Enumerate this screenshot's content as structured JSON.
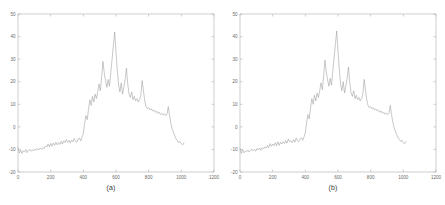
{
  "figure": {
    "background_color": "#ffffff",
    "axis_color": "#b9b9b9",
    "line_color": "#9a9a9a",
    "tick_label_color": "#6b6b6b",
    "caption_color": "#3a3a3a"
  },
  "panels": [
    {
      "caption": "(a)"
    },
    {
      "caption": "(b)"
    }
  ],
  "chart_data": [
    {
      "type": "line",
      "title": "",
      "subtitle": "",
      "caption": "(a)",
      "xlabel": "",
      "ylabel": "",
      "xlim": [
        0,
        1200
      ],
      "ylim": [
        -20,
        50
      ],
      "xticks": [
        0,
        200,
        400,
        600,
        800,
        1000,
        1200
      ],
      "xticklabels": [
        "0",
        "200",
        "400",
        "600",
        "800",
        "1000",
        "1200"
      ],
      "yticks": [
        -20,
        -10,
        0,
        10,
        20,
        30,
        40,
        50
      ],
      "yticklabels": [
        "-20",
        "-10",
        "0",
        "10",
        "20",
        "30",
        "40",
        "50"
      ],
      "grid": false,
      "legend": null,
      "legend_position": "none",
      "series": [
        {
          "name": "spectrum-a",
          "color": "#9a9a9a",
          "x": [
            0,
            8,
            16,
            24,
            32,
            40,
            48,
            56,
            64,
            72,
            80,
            88,
            96,
            104,
            112,
            120,
            128,
            136,
            144,
            152,
            160,
            168,
            176,
            184,
            192,
            200,
            208,
            216,
            224,
            232,
            240,
            248,
            256,
            264,
            272,
            280,
            288,
            296,
            304,
            312,
            320,
            328,
            336,
            344,
            352,
            360,
            368,
            376,
            384,
            392,
            400,
            408,
            416,
            424,
            432,
            440,
            448,
            456,
            464,
            472,
            480,
            488,
            496,
            504,
            512,
            520,
            528,
            536,
            544,
            552,
            560,
            568,
            576,
            584,
            592,
            600,
            608,
            616,
            624,
            632,
            640,
            648,
            656,
            664,
            672,
            680,
            688,
            696,
            704,
            712,
            720,
            728,
            736,
            744,
            752,
            760,
            768,
            776,
            784,
            792,
            800,
            808,
            816,
            824,
            832,
            840,
            848,
            856,
            864,
            872,
            880,
            888,
            896,
            904,
            912,
            920,
            928,
            936,
            944,
            952,
            960,
            968,
            976,
            984,
            992,
            1000,
            1008,
            1016,
            1024
          ],
          "y": [
            -9.0,
            -11.6,
            -10.2,
            -11.8,
            -10.6,
            -11.2,
            -10.0,
            -11.4,
            -10.4,
            -10.0,
            -10.8,
            -10.2,
            -10.6,
            -9.8,
            -10.4,
            -9.6,
            -10.2,
            -9.4,
            -10.0,
            -9.2,
            -9.6,
            -8.4,
            -9.0,
            -7.6,
            -8.8,
            -7.4,
            -8.6,
            -7.2,
            -8.2,
            -6.8,
            -8.0,
            -7.0,
            -7.8,
            -6.4,
            -7.6,
            -6.2,
            -7.0,
            -5.6,
            -6.8,
            -6.0,
            -7.2,
            -5.8,
            -6.6,
            -5.2,
            -6.4,
            -6.8,
            -5.4,
            -5.0,
            -6.2,
            -4.6,
            -3.0,
            1.5,
            5.0,
            3.2,
            8.0,
            12.0,
            9.5,
            13.5,
            11.0,
            14.5,
            12.5,
            15.5,
            19.0,
            16.0,
            22.0,
            29.0,
            24.0,
            20.5,
            17.5,
            21.0,
            18.0,
            24.0,
            30.0,
            36.0,
            42.0,
            33.0,
            25.0,
            18.5,
            15.5,
            19.5,
            14.5,
            17.5,
            21.0,
            26.0,
            19.0,
            14.5,
            13.0,
            15.5,
            12.0,
            13.5,
            11.5,
            12.5,
            11.0,
            12.0,
            14.0,
            20.5,
            16.0,
            11.5,
            9.0,
            8.0,
            8.5,
            7.5,
            8.0,
            7.0,
            7.5,
            6.5,
            7.0,
            6.0,
            6.5,
            5.5,
            6.0,
            5.2,
            5.8,
            5.0,
            5.5,
            9.0,
            5.0,
            1.5,
            -1.0,
            -2.5,
            -4.0,
            -5.5,
            -6.0,
            -7.0,
            -6.5,
            -7.5,
            -8.0,
            -7.0
          ]
        }
      ],
      "annotations": {
        "baseline_level": -10,
        "main_peak": {
          "x": 480,
          "y": 42
        },
        "secondary_peaks": [
          {
            "x": 440,
            "y": 29
          },
          {
            "x": 536,
            "y": 26
          },
          {
            "x": 616,
            "y": 20.5
          },
          {
            "x": 764,
            "y": 9
          }
        ]
      }
    },
    {
      "type": "line",
      "title": "",
      "subtitle": "",
      "caption": "(b)",
      "xlabel": "",
      "ylabel": "",
      "xlim": [
        0,
        1200
      ],
      "ylim": [
        -20,
        50
      ],
      "xticks": [
        0,
        200,
        400,
        600,
        800,
        1000,
        1200
      ],
      "xticklabels": [
        "0",
        "200",
        "400",
        "600",
        "800",
        "1000",
        "1200"
      ],
      "yticks": [
        -20,
        -10,
        0,
        10,
        20,
        30,
        40,
        50
      ],
      "yticklabels": [
        "-20",
        "-10",
        "0",
        "10",
        "20",
        "30",
        "40",
        "50"
      ],
      "grid": false,
      "legend": null,
      "legend_position": "none",
      "series": [
        {
          "name": "spectrum-b",
          "color": "#9a9a9a",
          "x": [
            0,
            8,
            16,
            24,
            32,
            40,
            48,
            56,
            64,
            72,
            80,
            88,
            96,
            104,
            112,
            120,
            128,
            136,
            144,
            152,
            160,
            168,
            176,
            184,
            192,
            200,
            208,
            216,
            224,
            232,
            240,
            248,
            256,
            264,
            272,
            280,
            288,
            296,
            304,
            312,
            320,
            328,
            336,
            344,
            352,
            360,
            368,
            376,
            384,
            392,
            400,
            408,
            416,
            424,
            432,
            440,
            448,
            456,
            464,
            472,
            480,
            488,
            496,
            504,
            512,
            520,
            528,
            536,
            544,
            552,
            560,
            568,
            576,
            584,
            592,
            600,
            608,
            616,
            624,
            632,
            640,
            648,
            656,
            664,
            672,
            680,
            688,
            696,
            704,
            712,
            720,
            728,
            736,
            744,
            752,
            760,
            768,
            776,
            784,
            792,
            800,
            808,
            816,
            824,
            832,
            840,
            848,
            856,
            864,
            872,
            880,
            888,
            896,
            904,
            912,
            920,
            928,
            936,
            944,
            952,
            960,
            968,
            976,
            984,
            992,
            1000,
            1008,
            1016,
            1024
          ],
          "y": [
            -9.5,
            -11.8,
            -10.0,
            -11.5,
            -10.8,
            -11.0,
            -10.2,
            -11.2,
            -10.6,
            -9.8,
            -10.6,
            -10.0,
            -10.8,
            -9.6,
            -10.2,
            -9.4,
            -10.4,
            -9.2,
            -9.8,
            -9.0,
            -9.4,
            -8.2,
            -9.2,
            -7.4,
            -8.6,
            -7.6,
            -8.4,
            -7.0,
            -8.4,
            -6.6,
            -8.2,
            -6.8,
            -7.6,
            -6.6,
            -7.4,
            -6.0,
            -7.2,
            -5.4,
            -6.6,
            -6.2,
            -7.0,
            -5.6,
            -6.8,
            -5.0,
            -6.2,
            -6.6,
            -5.2,
            -4.8,
            -6.0,
            -4.4,
            -2.5,
            2.0,
            5.5,
            3.5,
            8.5,
            12.5,
            10.0,
            14.0,
            11.5,
            15.0,
            13.0,
            16.0,
            19.5,
            16.5,
            22.5,
            29.5,
            24.5,
            21.0,
            18.0,
            21.5,
            18.5,
            24.5,
            30.5,
            36.5,
            42.5,
            33.5,
            25.5,
            19.0,
            16.0,
            20.0,
            15.0,
            18.0,
            21.5,
            26.5,
            19.5,
            15.0,
            13.5,
            16.0,
            12.5,
            14.0,
            12.0,
            13.0,
            11.5,
            12.5,
            14.5,
            21.0,
            16.5,
            12.0,
            9.5,
            8.5,
            9.0,
            8.0,
            8.5,
            7.5,
            8.0,
            7.0,
            7.5,
            6.5,
            7.0,
            6.0,
            6.5,
            5.6,
            6.2,
            5.4,
            6.0,
            9.5,
            5.4,
            2.0,
            -0.5,
            -2.0,
            -3.5,
            -5.0,
            -5.5,
            -6.5,
            -6.0,
            -7.0,
            -7.5,
            -6.5
          ]
        }
      ],
      "annotations": {
        "baseline_level": -10,
        "main_peak": {
          "x": 480,
          "y": 42.5
        },
        "secondary_peaks": [
          {
            "x": 440,
            "y": 29.5
          },
          {
            "x": 536,
            "y": 26.5
          },
          {
            "x": 616,
            "y": 21
          },
          {
            "x": 764,
            "y": 9.5
          }
        ]
      }
    }
  ]
}
